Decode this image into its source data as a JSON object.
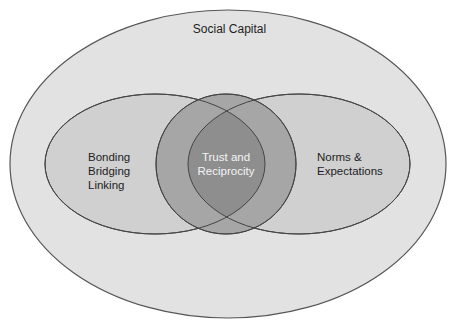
{
  "diagram": {
    "type": "venn",
    "outer": {
      "label": "Social Capital",
      "fill": "#e2e2e2",
      "stroke": "#555555"
    },
    "left_set": {
      "lines": [
        "Bonding",
        "Bridging",
        "Linking"
      ],
      "fill": "#cfcfcf"
    },
    "right_set": {
      "lines": [
        "Norms &",
        "Expectations"
      ],
      "fill": "#cfcfcf"
    },
    "center_set": {
      "lines": [
        "Trust and",
        "Reciprocity"
      ],
      "fill": "#a3a3a3",
      "text_color": "#f4f4f4"
    },
    "intersection_fill": "#8a8a8a"
  }
}
